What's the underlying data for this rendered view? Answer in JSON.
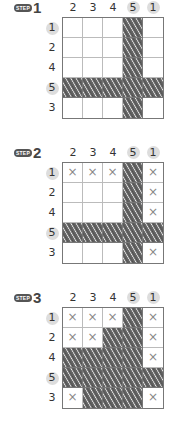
{
  "columns": [
    "2",
    "3",
    "4",
    "5",
    "1"
  ],
  "rows": [
    "1",
    "2",
    "4",
    "5",
    "3"
  ],
  "highlighted_columns": [
    3,
    4
  ],
  "highlighted_rows": [
    0,
    3
  ],
  "badge_label": "STEP",
  "legend": {
    "fill": "shaded",
    "cross": "×",
    "empty": ""
  },
  "steps": [
    {
      "number": "1",
      "grid": [
        [
          "",
          "",
          "",
          "fill",
          ""
        ],
        [
          "",
          "",
          "",
          "fill",
          ""
        ],
        [
          "",
          "",
          "",
          "fill",
          ""
        ],
        [
          "fill",
          "fill",
          "fill",
          "fill",
          "fill"
        ],
        [
          "",
          "",
          "",
          "fill",
          ""
        ]
      ]
    },
    {
      "number": "2",
      "grid": [
        [
          "x",
          "x",
          "x",
          "fill",
          "x"
        ],
        [
          "",
          "",
          "",
          "fill",
          "x"
        ],
        [
          "",
          "",
          "",
          "fill",
          "x"
        ],
        [
          "fill",
          "fill",
          "fill",
          "fill",
          "fill"
        ],
        [
          "",
          "",
          "",
          "fill",
          "x"
        ]
      ]
    },
    {
      "number": "3",
      "grid": [
        [
          "x",
          "x",
          "x",
          "fill",
          "x"
        ],
        [
          "x",
          "x",
          "fill",
          "fill",
          "x"
        ],
        [
          "fill",
          "fill",
          "fill",
          "fill",
          "x"
        ],
        [
          "fill",
          "fill",
          "fill",
          "fill",
          "fill"
        ],
        [
          "x",
          "fill",
          "fill",
          "fill",
          "x"
        ]
      ]
    }
  ]
}
